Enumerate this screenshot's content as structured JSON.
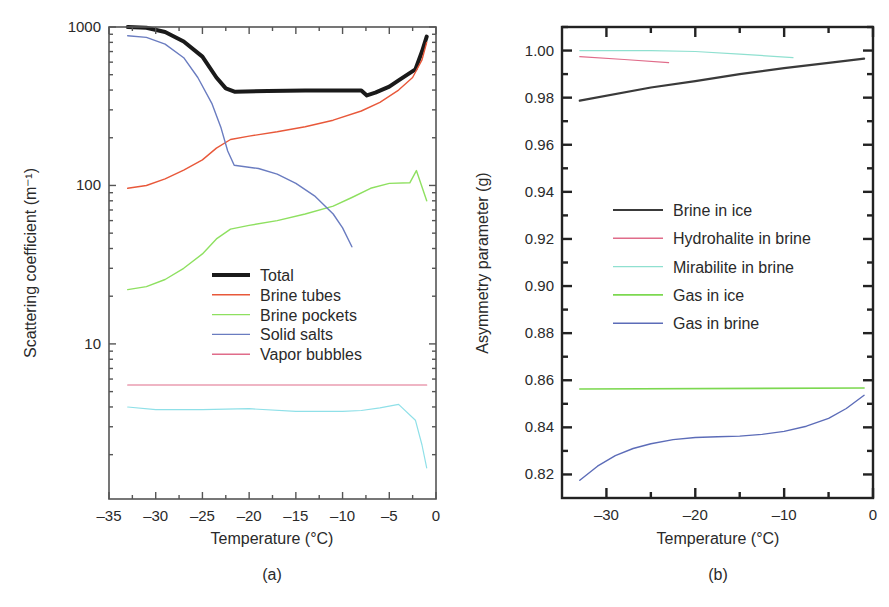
{
  "chart_data": [
    {
      "id": "a",
      "type": "line",
      "panel_label": "(a)",
      "title": "",
      "xlabel": "Temperature (°C)",
      "ylabel": "Scattering coefficient (m⁻¹)",
      "yscale": "log",
      "xlim": [
        -35,
        0
      ],
      "ylim": [
        1.05,
        1000
      ],
      "xticks": [
        -35,
        -30,
        -25,
        -20,
        -15,
        -10,
        -5,
        0
      ],
      "xtick_labels": [
        "–35",
        "–30",
        "–25",
        "–20",
        "–15",
        "–10",
        "–5",
        "0"
      ],
      "yticks": [
        10,
        100,
        1000
      ],
      "ytick_labels": [
        "10",
        "100",
        "1000"
      ],
      "grid": false,
      "legend_position": "center",
      "series": [
        {
          "name": "Total",
          "color": "#1a1a1a",
          "width": 4,
          "in_legend": true,
          "x": [
            -33,
            -31,
            -29,
            -27,
            -25,
            -23.5,
            -22.5,
            -21.5,
            -18,
            -14,
            -10,
            -8,
            -7.4,
            -6.5,
            -5,
            -4,
            -2.2,
            -1.5,
            -1
          ],
          "y": [
            1000,
            990,
            930,
            810,
            650,
            480,
            410,
            390,
            395,
            398,
            398,
            398,
            370,
            385,
            420,
            460,
            540,
            700,
            870
          ]
        },
        {
          "name": "Brine tubes",
          "color": "#e8583a",
          "width": 1.4,
          "in_legend": true,
          "x": [
            -33,
            -31,
            -29,
            -27,
            -25,
            -23.5,
            -22,
            -20,
            -17,
            -14,
            -11,
            -8,
            -6,
            -4,
            -2.5,
            -1.5,
            -1
          ],
          "y": [
            96,
            100,
            110,
            125,
            145,
            172,
            195,
            205,
            218,
            235,
            258,
            295,
            335,
            400,
            480,
            620,
            800
          ]
        },
        {
          "name": "Brine pockets",
          "color": "#8ee060",
          "width": 1.4,
          "in_legend": true,
          "x": [
            -33,
            -31,
            -29,
            -27,
            -25,
            -23.5,
            -22,
            -20,
            -17,
            -14,
            -11,
            -9,
            -7,
            -5,
            -2.8,
            -2.1,
            -1
          ],
          "y": [
            22,
            23,
            25.5,
            30,
            37,
            46,
            53,
            56,
            60,
            66,
            74,
            84,
            96,
            103,
            104,
            124,
            80
          ]
        },
        {
          "name": "Solid salts",
          "color": "#6a7cc0",
          "width": 1.4,
          "in_legend": true,
          "x": [
            -33,
            -31,
            -29,
            -27,
            -25.5,
            -24,
            -23,
            -22.3,
            -21.6,
            -19,
            -17,
            -15,
            -13,
            -11,
            -10,
            -9
          ],
          "y": [
            880,
            860,
            780,
            640,
            480,
            330,
            230,
            165,
            134,
            128,
            118,
            103,
            86,
            66,
            54,
            41
          ]
        },
        {
          "name": "Vapor bubbles",
          "color": "#e06c8a",
          "width": 1.2,
          "in_legend": true,
          "x": [
            -33,
            -1
          ],
          "y": [
            5.5,
            5.5
          ]
        },
        {
          "name": "",
          "color": "#8fe0e8",
          "width": 1.2,
          "in_legend": false,
          "x": [
            -33,
            -30,
            -25,
            -20,
            -15,
            -10,
            -8,
            -6,
            -4,
            -2.2,
            -1.5,
            -1
          ],
          "y": [
            4.0,
            3.85,
            3.85,
            3.9,
            3.75,
            3.75,
            3.8,
            3.95,
            4.15,
            3.3,
            2.3,
            1.65
          ]
        }
      ]
    },
    {
      "id": "b",
      "type": "line",
      "panel_label": "(b)",
      "title": "",
      "xlabel": "Temperature (°C)",
      "ylabel": "Asymmetry parameter (g)",
      "yscale": "linear",
      "xlim": [
        -35,
        0
      ],
      "ylim": [
        0.81,
        1.01
      ],
      "xticks": [
        -30,
        -20,
        -10,
        0
      ],
      "xtick_labels": [
        "–30",
        "–20",
        "–10",
        "0"
      ],
      "xminor": [
        -25,
        -15,
        -5
      ],
      "yticks": [
        0.82,
        0.84,
        0.86,
        0.88,
        0.9,
        0.92,
        0.94,
        0.96,
        0.98,
        1.0
      ],
      "ytick_labels": [
        "0.82",
        "0.84",
        "0.86",
        "0.88",
        "0.90",
        "0.92",
        "0.94",
        "0.96",
        "0.98",
        "1.00"
      ],
      "grid": false,
      "legend_position": "center",
      "series": [
        {
          "name": "Brine in ice",
          "color": "#3a3a3a",
          "width": 2.2,
          "in_legend": true,
          "x": [
            -33,
            -25,
            -20,
            -15,
            -10,
            -5,
            -1
          ],
          "y": [
            0.9787,
            0.9843,
            0.987,
            0.99,
            0.9925,
            0.9948,
            0.9966
          ]
        },
        {
          "name": "Hydrohalite in brine",
          "color": "#e06c8a",
          "width": 1.2,
          "in_legend": true,
          "x": [
            -33,
            -28,
            -23
          ],
          "y": [
            0.9974,
            0.9962,
            0.9949
          ]
        },
        {
          "name": "Mirabilite in brine",
          "color": "#8fe0d0",
          "width": 1.2,
          "in_legend": true,
          "x": [
            -33,
            -25,
            -20,
            -15,
            -9
          ],
          "y": [
            1.0,
            1.0,
            0.9996,
            0.9985,
            0.997
          ]
        },
        {
          "name": "Gas in ice",
          "color": "#7cd850",
          "width": 1.6,
          "in_legend": true,
          "x": [
            -33,
            -1
          ],
          "y": [
            0.8563,
            0.8567
          ]
        },
        {
          "name": "Gas in brine",
          "color": "#5c6cb8",
          "width": 1.4,
          "in_legend": true,
          "x": [
            -33,
            -31,
            -29,
            -27,
            -25,
            -22.5,
            -20,
            -17.5,
            -15,
            -12.5,
            -10,
            -7.5,
            -5,
            -3,
            -1
          ],
          "y": [
            0.8175,
            0.8235,
            0.828,
            0.831,
            0.833,
            0.8348,
            0.8357,
            0.836,
            0.8363,
            0.837,
            0.8383,
            0.8405,
            0.8438,
            0.848,
            0.8536
          ]
        }
      ]
    }
  ]
}
